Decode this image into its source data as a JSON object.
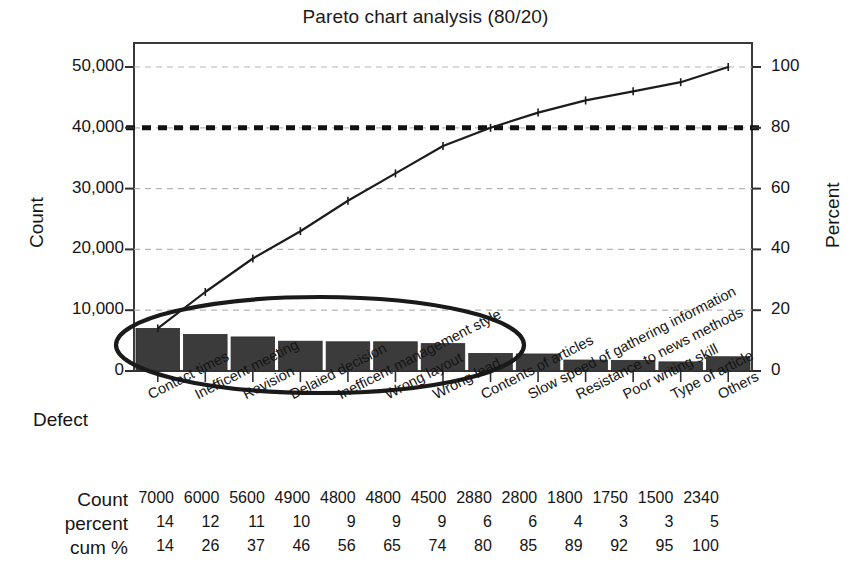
{
  "chart_data": {
    "type": "bar",
    "title": "Pareto chart analysis (80/20)",
    "xlabel": "Defect",
    "ylabel": "Count",
    "y2label": "Percent",
    "categories": [
      "Contact times",
      "Inefficent meeting",
      "Revision",
      "Delaied decision",
      "Inefficent management style",
      "Wrong layout",
      "Wrong lead",
      "Contents of articles",
      "Slow speed of gathering information",
      "Resistance to news methods",
      "Poor writing skill",
      "Type of article",
      "Others"
    ],
    "values": [
      7000,
      6000,
      5600,
      4900,
      4800,
      4800,
      4500,
      2880,
      2800,
      1800,
      1750,
      1500,
      2340
    ],
    "percent": [
      14,
      12,
      11,
      10,
      9,
      9,
      9,
      6,
      6,
      4,
      3,
      3,
      5
    ],
    "cum_percent": [
      14,
      26,
      37,
      46,
      56,
      65,
      74,
      80,
      85,
      89,
      92,
      95,
      100
    ],
    "ylim": [
      0,
      50000
    ],
    "y2lim": [
      0,
      100
    ],
    "yticks": [
      "0",
      "10,000",
      "20,000",
      "30,000",
      "40,000",
      "50,000"
    ],
    "ytick_values": [
      0,
      10000,
      20000,
      30000,
      40000,
      50000
    ],
    "y2ticks": [
      "0",
      "20",
      "40",
      "60",
      "80",
      "100"
    ],
    "y2tick_values": [
      0,
      20,
      40,
      60,
      80,
      100
    ],
    "grid": true,
    "legend": "none",
    "reference_line": {
      "label": "80",
      "value": 80,
      "style": "thick-dashed"
    },
    "annotation": {
      "shape": "ellipse",
      "covers_categories": 8,
      "description": "vital-few-ellipse"
    },
    "series": [
      {
        "name": "Count",
        "type": "bar",
        "values": [
          7000,
          6000,
          5600,
          4900,
          4800,
          4800,
          4500,
          2880,
          2800,
          1800,
          1750,
          1500,
          2340
        ]
      },
      {
        "name": "Cum %",
        "type": "line",
        "values": [
          14,
          26,
          37,
          46,
          56,
          65,
          74,
          80,
          85,
          89,
          92,
          95,
          100
        ]
      }
    ],
    "colors": {
      "bar": "#3b3b3b",
      "line": "#1c1c1c",
      "grid": "#b6b6b6",
      "reference": "#111111",
      "annotation": "#1a1a1a"
    }
  },
  "table": {
    "rows": [
      {
        "label": "Count",
        "cells": [
          "7000",
          "6000",
          "5600",
          "4900",
          "4800",
          "4800",
          "4500",
          "2880",
          "2800",
          "1800",
          "1750",
          "1500",
          "2340"
        ]
      },
      {
        "label": "percent",
        "cells": [
          "14",
          "12",
          "11",
          "10",
          "9",
          "9",
          "9",
          "6",
          "6",
          "4",
          "3",
          "3",
          "5"
        ]
      },
      {
        "label": "cum %",
        "cells": [
          "14",
          "26",
          "37",
          "46",
          "56",
          "65",
          "74",
          "80",
          "85",
          "89",
          "92",
          "95",
          "100"
        ]
      }
    ]
  }
}
